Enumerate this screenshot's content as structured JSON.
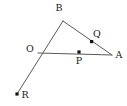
{
  "figure": {
    "type": "plane-geometry-line-figure",
    "background_color": "#ffffff",
    "stroke_color": "#5a5a5a",
    "label_color": "#1a1a1a",
    "point_color": "#111111",
    "stroke_width": 1,
    "canvas": {
      "width": 127,
      "height": 106
    }
  },
  "points": [
    {
      "id": "B",
      "label": "B",
      "x": 63,
      "y": 21,
      "marker": "none",
      "label_x": 59,
      "label_y": 11,
      "anchor": "middle"
    },
    {
      "id": "O",
      "label": "O",
      "x": 38,
      "y": 53,
      "marker": "none",
      "label_x": 30,
      "label_y": 52,
      "anchor": "middle"
    },
    {
      "id": "A",
      "label": "A",
      "x": 112,
      "y": 55,
      "marker": "none",
      "label_x": 119,
      "label_y": 58,
      "anchor": "middle"
    },
    {
      "id": "Q",
      "label": "Q",
      "x": 92,
      "y": 42,
      "marker": "square",
      "label_x": 97,
      "label_y": 37,
      "anchor": "middle"
    },
    {
      "id": "P",
      "label": "P",
      "x": 79,
      "y": 52,
      "marker": "square",
      "label_x": 79,
      "label_y": 64,
      "anchor": "middle"
    },
    {
      "id": "R",
      "label": "R",
      "x": 17,
      "y": 94,
      "marker": "square",
      "label_x": 25,
      "label_y": 98,
      "anchor": "middle"
    }
  ],
  "segments": [
    {
      "id": "seg-B-R",
      "from": "B",
      "to": "R",
      "x1": 63,
      "y1": 21,
      "x2": 17,
      "y2": 94
    },
    {
      "id": "seg-B-A",
      "from": "B",
      "to": "A",
      "x1": 63,
      "y1": 21,
      "x2": 112,
      "y2": 55
    },
    {
      "id": "seg-O-A",
      "from": "O",
      "to": "A",
      "x1": 38,
      "y1": 53,
      "x2": 112,
      "y2": 55
    }
  ],
  "labels": {
    "B": "B",
    "O": "O",
    "A": "A",
    "Q": "Q",
    "P": "P",
    "R": "R"
  }
}
